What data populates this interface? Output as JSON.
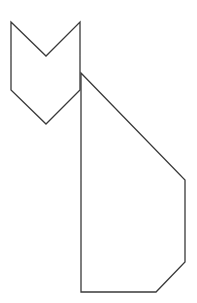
{
  "figure": {
    "stroke_color": "#3a3a3a",
    "fill_color": "#ffffff",
    "head": {
      "points": "11,22 46,56 80,22 80,90 46,124 11,90"
    },
    "body": {
      "points": "81,73 185,180 185,262 156,292 81,292"
    }
  }
}
